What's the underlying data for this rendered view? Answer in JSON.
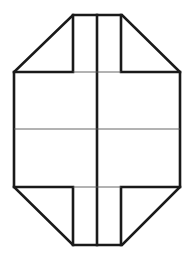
{
  "diagram": {
    "title": "",
    "colors": {
      "outline": "#1a1a1a",
      "guide_line": "#555555",
      "background": "#ffffff"
    },
    "labels": []
  }
}
